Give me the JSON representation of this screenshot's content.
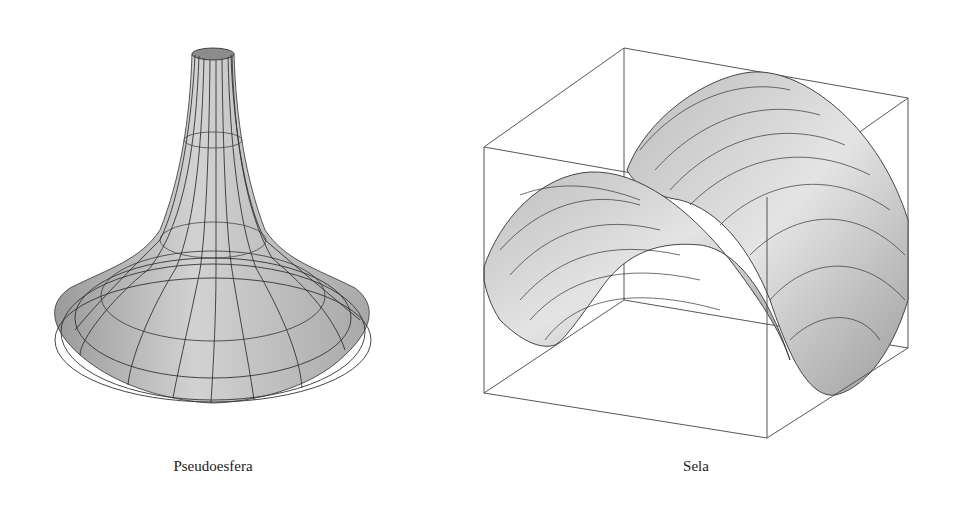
{
  "figures": [
    {
      "id": "pseudosphere",
      "caption": "Pseudoesfera"
    },
    {
      "id": "saddle",
      "caption": "Sela"
    }
  ],
  "colors": {
    "surface_fill": "#c8c8c8",
    "mesh_line": "#333333",
    "box_line": "#444444",
    "background": "#ffffff"
  }
}
